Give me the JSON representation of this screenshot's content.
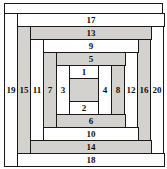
{
  "figure": {
    "type": "diagram",
    "width": 167,
    "height": 169,
    "colors": {
      "shaded": "#d4d2ce",
      "unshaded": "#ffffff",
      "line": "#1a1a1a",
      "text": "#111111",
      "background": "#ffffff"
    },
    "center": {
      "label": "",
      "shaded": true
    },
    "strips": [
      {
        "n": "1",
        "side": "top",
        "shaded": false,
        "x": 69,
        "y": 65,
        "w": 30,
        "h": 14
      },
      {
        "n": "2",
        "side": "bottom",
        "shaded": false,
        "x": 69,
        "y": 101,
        "w": 30,
        "h": 14
      },
      {
        "n": "3",
        "side": "left",
        "shaded": false,
        "x": 56,
        "y": 65,
        "w": 14,
        "h": 50
      },
      {
        "n": "4",
        "side": "right",
        "shaded": false,
        "x": 98,
        "y": 65,
        "w": 14,
        "h": 50
      },
      {
        "n": "5",
        "side": "top",
        "shaded": true,
        "x": 56,
        "y": 52,
        "w": 70,
        "h": 14
      },
      {
        "n": "6",
        "side": "bottom",
        "shaded": true,
        "x": 56,
        "y": 114,
        "w": 70,
        "h": 14
      },
      {
        "n": "7",
        "side": "left",
        "shaded": true,
        "x": 43,
        "y": 52,
        "w": 14,
        "h": 76
      },
      {
        "n": "8",
        "side": "right",
        "shaded": true,
        "x": 111,
        "y": 52,
        "w": 14,
        "h": 76
      },
      {
        "n": "9",
        "side": "top",
        "shaded": false,
        "x": 43,
        "y": 39,
        "w": 96,
        "h": 14
      },
      {
        "n": "10",
        "side": "bottom",
        "shaded": false,
        "x": 43,
        "y": 127,
        "w": 96,
        "h": 14
      },
      {
        "n": "11",
        "side": "left",
        "shaded": false,
        "x": 30,
        "y": 39,
        "w": 14,
        "h": 102
      },
      {
        "n": "12",
        "side": "right",
        "shaded": false,
        "x": 124,
        "y": 39,
        "w": 14,
        "h": 102
      },
      {
        "n": "13",
        "side": "top",
        "shaded": true,
        "x": 30,
        "y": 26,
        "w": 122,
        "h": 14
      },
      {
        "n": "14",
        "side": "bottom",
        "shaded": true,
        "x": 30,
        "y": 140,
        "w": 122,
        "h": 14
      },
      {
        "n": "15",
        "side": "left",
        "shaded": true,
        "x": 17,
        "y": 26,
        "w": 14,
        "h": 128
      },
      {
        "n": "16",
        "side": "right",
        "shaded": true,
        "x": 137,
        "y": 26,
        "w": 14,
        "h": 128
      },
      {
        "n": "17",
        "side": "top",
        "shaded": false,
        "x": 17,
        "y": 13,
        "w": 148,
        "h": 14
      },
      {
        "n": "18",
        "side": "bottom",
        "shaded": false,
        "x": 17,
        "y": 153,
        "w": 148,
        "h": 14
      },
      {
        "n": "19",
        "side": "left",
        "shaded": false,
        "x": 4,
        "y": 13,
        "w": 14,
        "h": 154
      },
      {
        "n": "20",
        "side": "right",
        "shaded": false,
        "x": 150,
        "y": 13,
        "w": 14,
        "h": 154
      }
    ]
  }
}
